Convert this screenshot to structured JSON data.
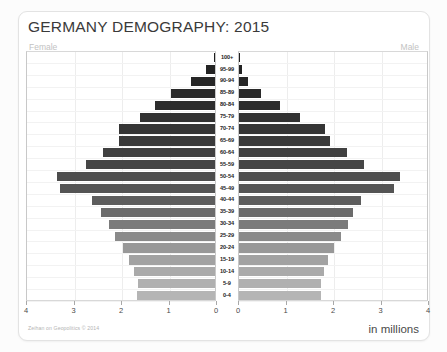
{
  "card": {
    "title": "GERMANY DEMOGRAPHY: 2015",
    "female_label": "Female",
    "male_label": "Male",
    "credit": "Zeihan on Geopolitics © 2014",
    "units": "in millions"
  },
  "chart_data": {
    "type": "bar",
    "subtype": "population-pyramid",
    "title": "GERMANY DEMOGRAPHY: 2015",
    "xlabel": "in millions",
    "ylabel": "",
    "xlim": [
      0,
      4
    ],
    "xticks": [
      0,
      1,
      2,
      3,
      4
    ],
    "left_axis_ticklabels": [
      "4",
      "3",
      "2",
      "1",
      "0"
    ],
    "right_axis_ticklabels": [
      "0",
      "1",
      "2",
      "3",
      "4"
    ],
    "grid": true,
    "legend": [
      "Female",
      "Male"
    ],
    "legend_position": "top-corners",
    "categories": [
      "100+",
      "95-99",
      "90-94",
      "85-89",
      "80-84",
      "75-79",
      "70-74",
      "65-69",
      "60-64",
      "55-59",
      "50-54",
      "45-49",
      "40-44",
      "35-39",
      "30-34",
      "25-29",
      "20-24",
      "15-19",
      "10-14",
      "5-9",
      "0-4"
    ],
    "series": [
      {
        "name": "Female",
        "side": "left",
        "values": [
          0.02,
          0.2,
          0.5,
          0.93,
          1.27,
          1.58,
          2.02,
          2.03,
          2.36,
          2.72,
          3.32,
          3.27,
          2.59,
          2.41,
          2.23,
          2.1,
          1.93,
          1.82,
          1.71,
          1.63,
          1.64
        ]
      },
      {
        "name": "Male",
        "side": "right",
        "values": [
          0.01,
          0.06,
          0.19,
          0.46,
          0.87,
          1.28,
          1.82,
          1.92,
          2.28,
          2.63,
          3.38,
          3.27,
          2.57,
          2.41,
          2.29,
          2.14,
          2.01,
          1.87,
          1.78,
          1.72,
          1.73
        ]
      }
    ],
    "bar_colors": [
      "#1f1f1f",
      "#232323",
      "#262626",
      "#2a2a2a",
      "#2d2d2d",
      "#313131",
      "#353535",
      "#3a3a3a",
      "#404040",
      "#464646",
      "#4d4d4d",
      "#545454",
      "#5d5d5d",
      "#6b6b6b",
      "#7b7b7b",
      "#8a8a8a",
      "#989898",
      "#a2a2a2",
      "#aaaaaa",
      "#b0b0b0",
      "#b5b5b5"
    ]
  }
}
